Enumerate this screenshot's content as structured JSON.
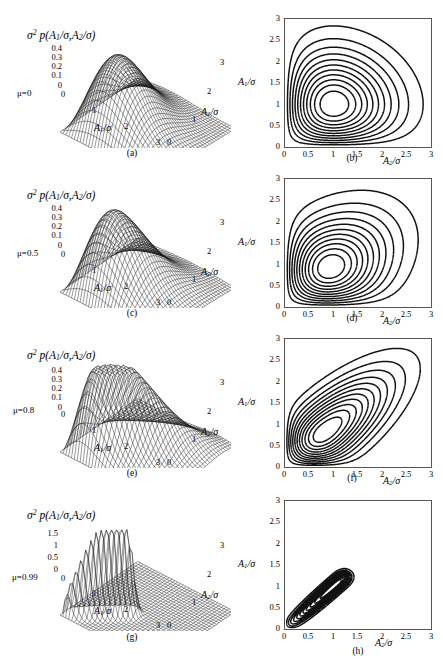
{
  "figure": {
    "panel_captions": [
      "(a)",
      "(b)",
      "(c)",
      "(d)",
      "(e)",
      "(f)",
      "(g)",
      "(h)"
    ],
    "surface_title": "σ² p(A₁/σ, A₂/σ)",
    "axis_A1": "A₁/σ",
    "axis_A2": "A₂/σ"
  },
  "rows": [
    {
      "mu_label": "μ=0",
      "surface_caption": "(a)",
      "contour_caption": "(b)"
    },
    {
      "mu_label": "μ=0.5",
      "surface_caption": "(c)",
      "contour_caption": "(d)"
    },
    {
      "mu_label": "μ=0.8",
      "surface_caption": "(e)",
      "contour_caption": "(f)"
    },
    {
      "mu_label": "μ=0.99",
      "surface_caption": "(g)",
      "contour_caption": "(h)"
    }
  ],
  "chart_data": [
    {
      "type": "surface",
      "panel": "(a)",
      "title": "σ² p(A₁/σ, A₂/σ)",
      "annotation": "μ=0",
      "xlabel": "A₁/σ",
      "ylabel": "A₂/σ",
      "zlabel": "σ² p(A₁/σ, A₂/σ)",
      "xlim": [
        0,
        3
      ],
      "ylim": [
        0,
        3
      ],
      "zlim": [
        0,
        0.4
      ],
      "xticks": [
        0,
        1,
        2,
        3
      ],
      "yticks": [
        0,
        1,
        2,
        3
      ],
      "zticks": [
        0,
        0.1,
        0.2,
        0.3,
        0.4
      ],
      "correlation_mu": 0,
      "peak_value": 0.37,
      "peak_location": [
        1.0,
        1.0
      ],
      "description": "Product of two independent Rayleigh densities; single broad rounded peak near A1/sigma=1, A2/sigma=1."
    },
    {
      "type": "contour",
      "panel": "(b)",
      "xlabel": "A₂/σ",
      "ylabel": "A₁/σ",
      "xlim": [
        0,
        3
      ],
      "ylim": [
        0,
        3
      ],
      "xticks": [
        0,
        0.5,
        1,
        1.5,
        2,
        2.5,
        3
      ],
      "yticks": [
        0,
        0.5,
        1,
        1.5,
        2,
        2.5,
        3
      ],
      "grid": false,
      "correlation_mu": 0,
      "n_levels": 11,
      "center": [
        1.0,
        1.0
      ],
      "tilt_deg": 0,
      "description": "Nested closed contours, nearly circular near the centre and bulging toward the axes; outermost contour reaches about 2.9 on both axes."
    },
    {
      "type": "surface",
      "panel": "(c)",
      "title": "σ² p(A₁/σ, A₂/σ)",
      "annotation": "μ=0.5",
      "xlabel": "A₁/σ",
      "ylabel": "A₂/σ",
      "zlabel": "σ² p(A₁/σ, A₂/σ)",
      "xlim": [
        0,
        3
      ],
      "ylim": [
        0,
        3
      ],
      "zlim": [
        0,
        0.4
      ],
      "xticks": [
        0,
        1,
        2,
        3
      ],
      "yticks": [
        0,
        1,
        2,
        3
      ],
      "zticks": [
        0,
        0.1,
        0.2,
        0.3,
        0.4
      ],
      "correlation_mu": 0.5,
      "peak_value": 0.4,
      "peak_location": [
        1.0,
        1.0
      ],
      "description": "Moderately correlated Rayleigh pair; peak slightly sharper and drawn toward the diagonal."
    },
    {
      "type": "contour",
      "panel": "(d)",
      "xlabel": "A₂/σ",
      "ylabel": "A₁/σ",
      "xlim": [
        0,
        3
      ],
      "ylim": [
        0,
        3
      ],
      "xticks": [
        0,
        0.5,
        1,
        1.5,
        2,
        2.5,
        3
      ],
      "yticks": [
        0,
        0.5,
        1,
        1.5,
        2,
        2.5,
        3
      ],
      "grid": false,
      "correlation_mu": 0.5,
      "n_levels": 11,
      "center": [
        1.05,
        0.95
      ],
      "tilt_deg": 18,
      "description": "Contours begin to tilt along the 45 degree diagonal and become slightly egg shaped."
    },
    {
      "type": "surface",
      "panel": "(e)",
      "title": "σ² p(A₁/σ, A₂/σ)",
      "annotation": "μ=0.8",
      "xlabel": "A₁/σ",
      "ylabel": "A₂/σ",
      "zlabel": "σ² p(A₁/σ, A₂/σ)",
      "xlim": [
        0,
        3
      ],
      "ylim": [
        0,
        3
      ],
      "zlim": [
        0,
        0.4
      ],
      "xticks": [
        0,
        1,
        2,
        3
      ],
      "yticks": [
        0,
        1,
        2,
        3
      ],
      "zticks": [
        0,
        0.1,
        0.2,
        0.3,
        0.4
      ],
      "correlation_mu": 0.8,
      "peak_value": 0.45,
      "peak_location": [
        1.0,
        1.0
      ],
      "description": "Strongly correlated; the surface forms a ridge running along the diagonal A1=A2."
    },
    {
      "type": "contour",
      "panel": "(f)",
      "xlabel": "A₂/σ",
      "ylabel": "A₁/σ",
      "xlim": [
        0,
        3
      ],
      "ylim": [
        0,
        3
      ],
      "xticks": [
        0,
        0.5,
        1,
        1.5,
        2,
        2.5,
        3
      ],
      "yticks": [
        0,
        0.5,
        1,
        1.5,
        2,
        2.5,
        3
      ],
      "grid": false,
      "correlation_mu": 0.8,
      "n_levels": 11,
      "center": [
        1.0,
        0.85
      ],
      "tilt_deg": 42,
      "description": "Elongated elliptical contours inclined at about 45 degrees, stretching from the origin to roughly (2.9, 2.9)."
    },
    {
      "type": "surface",
      "panel": "(g)",
      "title": "σ² p(A₁/σ, A₂/σ)",
      "annotation": "μ=0.99",
      "xlabel": "A₁/σ",
      "ylabel": "A₂/σ",
      "zlabel": "σ² p(A₁/σ, A₂/σ)",
      "xlim": [
        0,
        3
      ],
      "ylim": [
        0,
        3
      ],
      "zlim": [
        0,
        1.5
      ],
      "xticks": [
        0,
        1,
        2,
        3
      ],
      "yticks": [
        0,
        1,
        2,
        3
      ],
      "zticks": [
        0,
        0.5,
        1,
        1.5
      ],
      "correlation_mu": 0.99,
      "peak_value": 1.5,
      "peak_location": [
        1.0,
        1.0
      ],
      "description": "Nearly fully correlated; a tall narrow ridge along A1=A2 with the vertical scale extended to 1.5."
    },
    {
      "type": "contour",
      "panel": "(h)",
      "xlabel": "A₂/σ",
      "ylabel": "A₁/σ",
      "xlim": [
        0,
        3
      ],
      "ylim": [
        0,
        3
      ],
      "xticks": [
        0,
        0.5,
        1,
        1.5,
        2,
        2.5,
        3
      ],
      "yticks": [
        0,
        0.5,
        1,
        1.5,
        2,
        2.5,
        3
      ],
      "grid": false,
      "correlation_mu": 0.99,
      "n_levels": 11,
      "center": [
        1.4,
        1.4
      ],
      "tilt_deg": 45,
      "description": "Extremely slender contours packed along the diagonal, forming a near-degenerate cigar from the origin to (2.9, 2.9)."
    }
  ],
  "ticks": {
    "z_small": [
      "0.4",
      "0.3",
      "0.2",
      "0.1",
      "0"
    ],
    "z_large": [
      "1.5",
      "1",
      "0.5",
      "0"
    ],
    "axis_3d": [
      "0",
      "1",
      "2",
      "3"
    ],
    "contour_y": [
      "3",
      "2.5",
      "2",
      "1.5",
      "1",
      "0.5",
      "0"
    ],
    "contour_x": [
      "0",
      "0.5",
      "1",
      "1.5",
      "2",
      "2.5",
      "3"
    ]
  }
}
